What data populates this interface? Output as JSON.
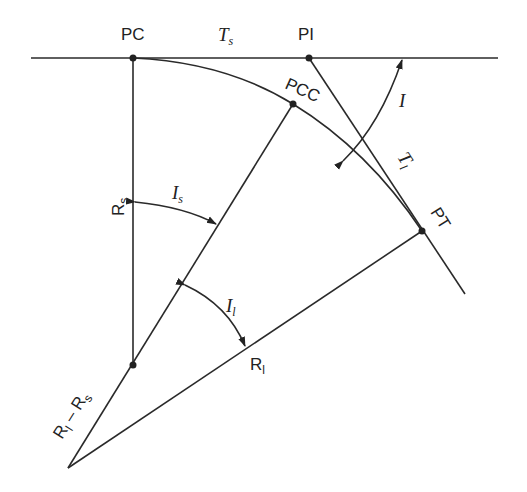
{
  "diagram": {
    "points": {
      "pc": {
        "label": "PC",
        "x": 133,
        "y": 58
      },
      "pi": {
        "label": "PI",
        "x": 309,
        "y": 58
      },
      "pcc": {
        "label": "PCC",
        "x": 293,
        "y": 104
      },
      "pt": {
        "label": "PT",
        "x": 422,
        "y": 231
      },
      "center_short": {
        "label": "",
        "x": 133,
        "y": 365
      },
      "center_long": {
        "label": "",
        "x": 68,
        "y": 468
      }
    },
    "labels": {
      "pc": "PC",
      "pi": "PI",
      "pcc": "PCC",
      "pt": "PT",
      "ts_main": "T",
      "ts_sub": "s",
      "tl_main": "T",
      "tl_sub": "l",
      "i_main": "I",
      "is_main": "I",
      "is_sub": "s",
      "il_main": "I",
      "il_sub": "l",
      "rs_main": "R",
      "rs_sub": "s",
      "rl_main": "R",
      "rl_sub": "l",
      "rlrs_main1": "R",
      "rlrs_sub1": "l",
      "rlrs_minus": " – ",
      "rlrs_main2": "R",
      "rlrs_sub2": "s"
    }
  }
}
